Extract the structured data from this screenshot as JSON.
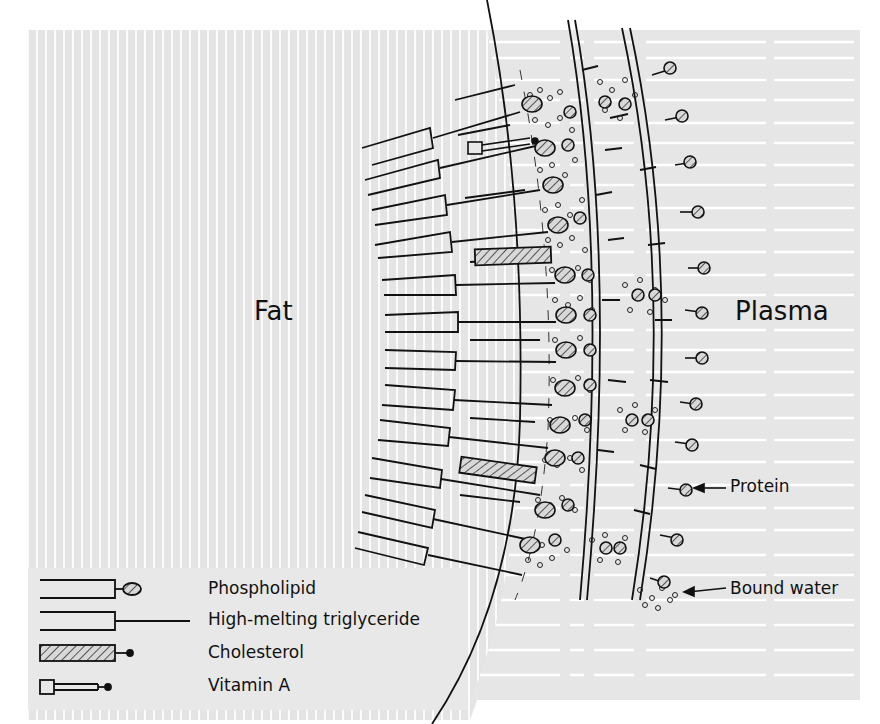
{
  "diagram": {
    "regions": {
      "fat_label": "Fat",
      "plasma_label": "Plasma"
    },
    "annotations": {
      "protein_label": "Protein",
      "bound_water_label": "Bound water"
    },
    "legend": {
      "items": [
        {
          "symbol": "phospholipid-symbol",
          "label": "Phospholipid"
        },
        {
          "symbol": "triglyceride-symbol",
          "label": "High-melting triglyceride"
        },
        {
          "symbol": "cholesterol-symbol",
          "label": "Cholesterol"
        },
        {
          "symbol": "vitamin-a-symbol",
          "label": "Vitamin A"
        }
      ]
    },
    "colors": {
      "background_fill": "#e6e6e6",
      "ink": "#1a1a1a",
      "stripe": "#ffffff"
    }
  }
}
